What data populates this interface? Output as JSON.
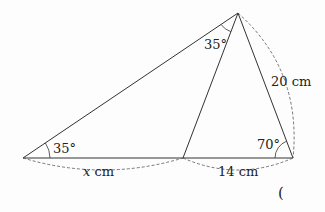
{
  "diagram": {
    "type": "geometry-triangle",
    "points": {
      "A": {
        "x": 23,
        "y": 158
      },
      "B": {
        "x": 183,
        "y": 158
      },
      "C": {
        "x": 293,
        "y": 158
      },
      "D": {
        "x": 238,
        "y": 13
      }
    },
    "angles": {
      "at_A": "35°",
      "at_D_left": "35°",
      "at_C": "70°"
    },
    "lengths": {
      "AB": "x cm",
      "AB_var": "x",
      "AB_unit": " cm",
      "BC": "14 cm",
      "CD": "20 cm"
    },
    "answer_paren": "("
  }
}
